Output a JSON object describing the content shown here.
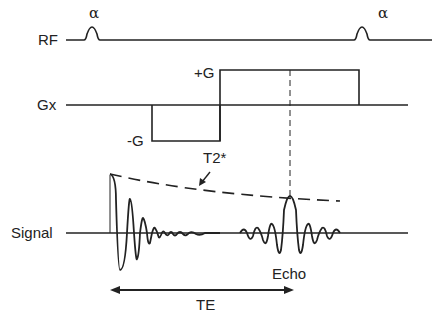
{
  "diagram": {
    "rows": {
      "rf": {
        "label": "RF",
        "pulse_label": "α"
      },
      "gx": {
        "label": "Gx",
        "positive_lobe": "+G",
        "negative_lobe": "-G"
      },
      "signal": {
        "label": "Signal",
        "decay_label": "T2*",
        "echo_label": "Echo"
      }
    },
    "interval": {
      "label": "TE"
    },
    "colors": {
      "line": "#222222",
      "background": "#ffffff"
    }
  }
}
